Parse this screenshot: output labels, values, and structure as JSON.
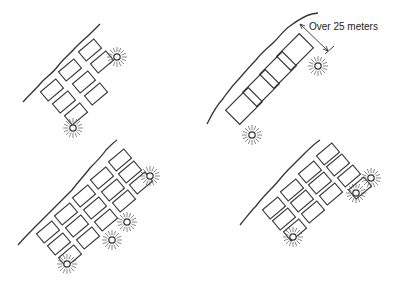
{
  "diagram": {
    "type": "parking-lot-lighting-layouts",
    "panels": [
      {
        "id": "top-left",
        "rows": 3,
        "stalls": 8,
        "lights": 2
      },
      {
        "id": "top-right",
        "rows": 1,
        "stalls": 4,
        "lights": 2,
        "dimension_label": "Over 25 meters"
      },
      {
        "id": "bottom-left",
        "rows": 4,
        "stalls": 17,
        "lights": 4
      },
      {
        "id": "bottom-right",
        "rows": 3,
        "stalls": 13,
        "lights": 3
      }
    ],
    "colors": {
      "line": "#333333",
      "background": "#ffffff"
    }
  },
  "labels": {
    "dimension": "Over 25 meters"
  }
}
